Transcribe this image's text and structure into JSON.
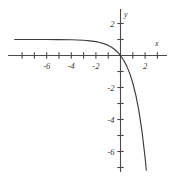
{
  "chart_data": {
    "type": "line",
    "title": "",
    "xlabel": "x",
    "ylabel": "y",
    "grid": false,
    "legend": null,
    "xlim": [
      -9,
      4
    ],
    "ylim": [
      -7.6,
      2.8
    ],
    "x_ticks": [
      -8,
      -7,
      -6,
      -5,
      -4,
      -3,
      -2,
      -1,
      1,
      2,
      3
    ],
    "y_ticks": [
      2,
      1,
      -1,
      -2,
      -3,
      -4,
      -5,
      -6,
      -7
    ],
    "x_tick_labels": [
      {
        "value": -6,
        "text": "-6"
      },
      {
        "value": -4,
        "text": "-4"
      },
      {
        "value": -2,
        "text": "-2"
      },
      {
        "value": 2,
        "text": "2"
      }
    ],
    "y_tick_labels": [
      {
        "value": 2,
        "text": "2"
      },
      {
        "value": -2,
        "text": "-2"
      },
      {
        "value": -4,
        "text": "-4"
      },
      {
        "value": -6,
        "text": "-6"
      }
    ],
    "series": [
      {
        "name": "y = 1 - e^x",
        "asymptote": 1,
        "x": [
          -8.6,
          -8.0,
          -7.0,
          -6.0,
          -5.0,
          -4.0,
          -3.5,
          -3.0,
          -2.5,
          -2.0,
          -1.75,
          -1.5,
          -1.25,
          -1.0,
          -0.75,
          -0.5,
          -0.25,
          0.0,
          0.25,
          0.5,
          0.75,
          1.0,
          1.25,
          1.5,
          1.75,
          2.0,
          2.1
        ],
        "values": [
          1.0,
          1.0,
          0.999,
          0.998,
          0.993,
          0.982,
          0.97,
          0.95,
          0.918,
          0.865,
          0.826,
          0.777,
          0.713,
          0.632,
          0.528,
          0.393,
          0.221,
          0.0,
          -0.284,
          -0.649,
          -1.117,
          -1.718,
          -2.49,
          -3.482,
          -4.755,
          -6.389,
          -7.166
        ]
      }
    ],
    "axis_labels": {
      "x_axis_name": "x",
      "y_axis_name": "y"
    },
    "colors": {
      "curve": "#3c3c3c",
      "axis": "#4a4a4a",
      "background": "#ffffff",
      "text": "#3a3a3a"
    }
  }
}
